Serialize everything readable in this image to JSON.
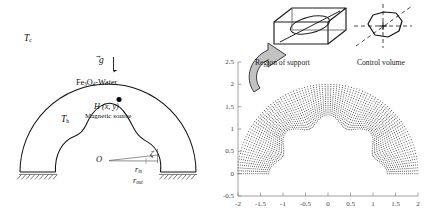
{
  "figure": {
    "panels": [
      "schematic",
      "node-distribution"
    ]
  },
  "left_panel": {
    "name": "semi-annular-cavity-schematic",
    "labels": {
      "cold_wall": "T",
      "cold_wall_sub": "c",
      "hot_wall": "T",
      "hot_wall_sub": "h",
      "gravity": "g",
      "fluid_1": "Fe",
      "fluid_sub_1": "3",
      "fluid_2": "O",
      "fluid_sub_2": "4",
      "fluid_3": "-Water",
      "magnetic_point": "H (x, y)",
      "magnetic_source": "Magnetic source",
      "origin": "O",
      "angle": "ζ",
      "radius_inner": "r",
      "radius_inner_sub": "in",
      "radius_outer": "r",
      "radius_outer_sub": "out"
    },
    "colors": {
      "outline": "#111111",
      "ground_hatch": "#555555",
      "source_dot": "#000000"
    }
  },
  "right_panel": {
    "name": "meshfree-node-distribution",
    "insets": {
      "region_of_support": "Region of support",
      "control_volume": "Control volume"
    },
    "colors": {
      "axis": "#7a7a7a",
      "node": "#4a4a4a",
      "inset_line": "#1a1a1a",
      "arrow_fill": "#b8b8b8"
    }
  },
  "chart_data": {
    "type": "scatter",
    "title": "",
    "xlabel": "",
    "ylabel": "",
    "xlim": [
      -2.15,
      2.15
    ],
    "ylim": [
      -0.62,
      2.62
    ],
    "xticks": [
      -2,
      -1.5,
      -1,
      -0.5,
      0,
      0.5,
      1,
      1.5,
      2
    ],
    "xticklabels": [
      "-2",
      "-1.5",
      "-1",
      "-0.5",
      "0",
      "0.5",
      "1",
      "1.5",
      "2"
    ],
    "yticks": [
      -0.5,
      0,
      0.5,
      1,
      1.5,
      2,
      2.5
    ],
    "yticklabels": [
      "-0.5",
      "0",
      "0.5",
      "1",
      "1.5",
      "2",
      "2.5"
    ],
    "grid": false,
    "legend": null,
    "geometry": {
      "center": [
        0,
        0
      ],
      "outer_radius": 2,
      "inner_mean_radius": 1.2,
      "inner_wave_amplitude": 0.12,
      "inner_wave_count": 4,
      "angular_nodes": 96,
      "radial_nodes": 16
    }
  }
}
